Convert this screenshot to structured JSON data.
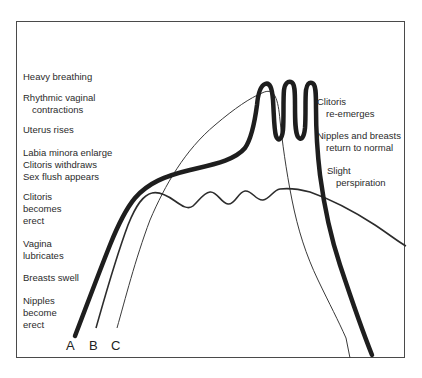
{
  "diagram": {
    "type": "response-curves",
    "curves": [
      {
        "id": "A",
        "label": "A",
        "style": "thick",
        "color": "#222222"
      },
      {
        "id": "B",
        "label": "B",
        "style": "medium",
        "color": "#333333"
      },
      {
        "id": "C",
        "label": "C",
        "style": "thin",
        "color": "#444444"
      }
    ],
    "left_labels": [
      {
        "lines": [
          "Heavy breathing"
        ]
      },
      {
        "lines": [
          "Rhythmic vaginal",
          "contractions"
        ]
      },
      {
        "lines": [
          "Uterus rises"
        ]
      },
      {
        "lines": [
          "Labia minora enlarge",
          "Clitoris withdraws",
          "Sex flush appears"
        ]
      },
      {
        "lines": [
          "Clitoris",
          "becomes",
          "erect"
        ]
      },
      {
        "lines": [
          "Vagina",
          "lubricates"
        ]
      },
      {
        "lines": [
          "Breasts swell"
        ]
      },
      {
        "lines": [
          "Nipples",
          "become",
          "erect"
        ]
      }
    ],
    "right_labels": [
      {
        "lines": [
          "Clitoris",
          "re-emerges"
        ]
      },
      {
        "lines": [
          "Nipples and breasts",
          "return to normal"
        ]
      },
      {
        "lines": [
          "Slight",
          "perspiration"
        ]
      }
    ],
    "curve_letters": [
      "A",
      "B",
      "C"
    ]
  }
}
